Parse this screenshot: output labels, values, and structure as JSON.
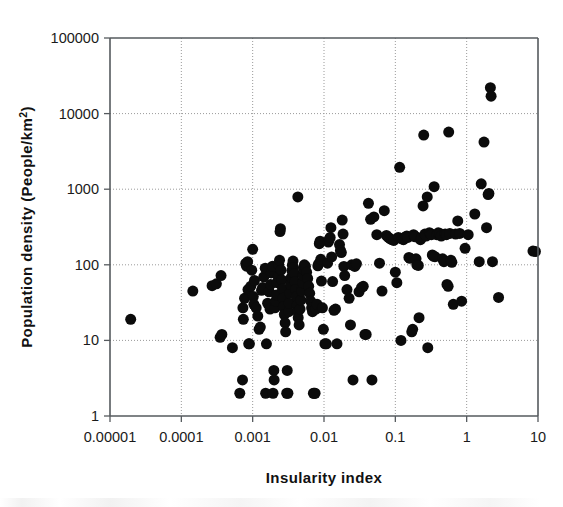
{
  "figure": {
    "background_color": "#ffffff",
    "marker_color": "#0b0b0b",
    "frame_color": "#555a5e",
    "grid_color": "#9a9a9a"
  },
  "chart_data": {
    "type": "scatter",
    "title": "",
    "xlabel": "Insularity index",
    "ylabel": "Population density (People/km2)",
    "ylabel_display": "Population density (People/km",
    "ylabel_superscript": "2",
    "ylabel_tail": ")",
    "xscale": "log",
    "yscale": "log",
    "xlim": [
      1e-05,
      10
    ],
    "ylim": [
      1,
      100000
    ],
    "grid": true,
    "legend": null,
    "xticks": [
      1e-05,
      0.0001,
      0.001,
      0.01,
      0.1,
      1,
      10
    ],
    "xtick_labels": [
      "0.00001",
      "0.0001",
      "0.001",
      "0.01",
      "0.1",
      "1",
      "10"
    ],
    "yticks": [
      1,
      10,
      100,
      1000,
      10000,
      100000
    ],
    "ytick_labels": [
      "1",
      "10",
      "100",
      "1000",
      "10000",
      "100000"
    ],
    "marker": "circle",
    "marker_size_px": 11,
    "n_points": 218,
    "points": [
      [
        1.95e-05,
        19
      ],
      [
        0.000145,
        45
      ],
      [
        0.00027,
        53
      ],
      [
        0.00031,
        56
      ],
      [
        0.00036,
        72
      ],
      [
        0.00035,
        11
      ],
      [
        0.00037,
        12
      ],
      [
        0.00052,
        8
      ],
      [
        0.00066,
        2
      ],
      [
        0.00072,
        3
      ],
      [
        0.00073,
        27
      ],
      [
        0.00074,
        19
      ],
      [
        0.00077,
        36
      ],
      [
        0.0008,
        104
      ],
      [
        0.00082,
        96
      ],
      [
        0.00085,
        110
      ],
      [
        0.00086,
        47
      ],
      [
        0.00088,
        9
      ],
      [
        0.0009,
        9
      ],
      [
        0.00094,
        52
      ],
      [
        0.00097,
        85
      ],
      [
        0.001,
        160
      ],
      [
        0.00102,
        38
      ],
      [
        0.00104,
        30
      ],
      [
        0.00106,
        62
      ],
      [
        0.00112,
        27
      ],
      [
        0.00118,
        21
      ],
      [
        0.00123,
        14
      ],
      [
        0.00128,
        15
      ],
      [
        0.00133,
        46
      ],
      [
        0.00138,
        50
      ],
      [
        0.00143,
        69
      ],
      [
        0.0015,
        90
      ],
      [
        0.00152,
        2
      ],
      [
        0.00156,
        9
      ],
      [
        0.00162,
        31
      ],
      [
        0.0017,
        44
      ],
      [
        0.00175,
        26
      ],
      [
        0.00178,
        55
      ],
      [
        0.00182,
        78
      ],
      [
        0.0019,
        96
      ],
      [
        0.00193,
        2
      ],
      [
        0.00198,
        4
      ],
      [
        0.002,
        3
      ],
      [
        0.00205,
        27
      ],
      [
        0.0021,
        33
      ],
      [
        0.00215,
        40
      ],
      [
        0.0022,
        58
      ],
      [
        0.00228,
        70
      ],
      [
        0.00233,
        100
      ],
      [
        0.00238,
        115
      ],
      [
        0.00242,
        275
      ],
      [
        0.00245,
        300
      ],
      [
        0.0025,
        85
      ],
      [
        0.00256,
        63
      ],
      [
        0.00262,
        48
      ],
      [
        0.00266,
        36
      ],
      [
        0.0027,
        28
      ],
      [
        0.00278,
        22
      ],
      [
        0.00285,
        17
      ],
      [
        0.0029,
        13
      ],
      [
        0.003,
        2
      ],
      [
        0.00305,
        4
      ],
      [
        0.00312,
        2
      ],
      [
        0.0032,
        24
      ],
      [
        0.00325,
        31
      ],
      [
        0.00332,
        42
      ],
      [
        0.0034,
        55
      ],
      [
        0.00348,
        68
      ],
      [
        0.00355,
        84
      ],
      [
        0.0036,
        99
      ],
      [
        0.00368,
        112
      ],
      [
        0.00375,
        92
      ],
      [
        0.00385,
        77
      ],
      [
        0.00392,
        60
      ],
      [
        0.004,
        47
      ],
      [
        0.0041,
        38
      ],
      [
        0.0042,
        29
      ],
      [
        0.00428,
        24
      ],
      [
        0.00435,
        20
      ],
      [
        0.0043,
        790
      ],
      [
        0.00448,
        16
      ],
      [
        0.00462,
        26
      ],
      [
        0.00475,
        34
      ],
      [
        0.00488,
        45
      ],
      [
        0.005,
        58
      ],
      [
        0.0051,
        72
      ],
      [
        0.0052,
        88
      ],
      [
        0.0053,
        100
      ],
      [
        0.0055,
        95
      ],
      [
        0.0057,
        80
      ],
      [
        0.0059,
        66
      ],
      [
        0.0061,
        52
      ],
      [
        0.0063,
        42
      ],
      [
        0.0065,
        33
      ],
      [
        0.0067,
        27
      ],
      [
        0.0069,
        24
      ],
      [
        0.0071,
        2
      ],
      [
        0.0073,
        2
      ],
      [
        0.0075,
        2
      ],
      [
        0.0077,
        26
      ],
      [
        0.008,
        30
      ],
      [
        0.0082,
        97
      ],
      [
        0.0084,
        103
      ],
      [
        0.0086,
        190
      ],
      [
        0.0088,
        205
      ],
      [
        0.009,
        118
      ],
      [
        0.0092,
        61
      ],
      [
        0.0095,
        27
      ],
      [
        0.0098,
        14
      ],
      [
        0.0103,
        9
      ],
      [
        0.0108,
        9
      ],
      [
        0.0112,
        105
      ],
      [
        0.0115,
        200
      ],
      [
        0.0118,
        215
      ],
      [
        0.0122,
        230
      ],
      [
        0.0125,
        310
      ],
      [
        0.0128,
        127
      ],
      [
        0.0132,
        60
      ],
      [
        0.0138,
        25
      ],
      [
        0.0145,
        26
      ],
      [
        0.0152,
        9
      ],
      [
        0.0165,
        185
      ],
      [
        0.017,
        155
      ],
      [
        0.0175,
        145
      ],
      [
        0.018,
        390
      ],
      [
        0.0185,
        255
      ],
      [
        0.019,
        95
      ],
      [
        0.0195,
        72
      ],
      [
        0.021,
        47
      ],
      [
        0.0225,
        36
      ],
      [
        0.0235,
        16
      ],
      [
        0.0245,
        100
      ],
      [
        0.0255,
        3
      ],
      [
        0.027,
        95
      ],
      [
        0.0285,
        103
      ],
      [
        0.031,
        44
      ],
      [
        0.0335,
        50
      ],
      [
        0.0355,
        52
      ],
      [
        0.0375,
        12
      ],
      [
        0.039,
        12
      ],
      [
        0.042,
        650
      ],
      [
        0.045,
        400
      ],
      [
        0.047,
        3
      ],
      [
        0.05,
        430
      ],
      [
        0.055,
        250
      ],
      [
        0.06,
        105
      ],
      [
        0.065,
        45
      ],
      [
        0.07,
        520
      ],
      [
        0.075,
        245
      ],
      [
        0.08,
        230
      ],
      [
        0.085,
        220
      ],
      [
        0.09,
        215
      ],
      [
        0.095,
        210
      ],
      [
        0.1,
        80
      ],
      [
        0.105,
        58
      ],
      [
        0.11,
        230
      ],
      [
        0.115,
        1950
      ],
      [
        0.118,
        225
      ],
      [
        0.12,
        10
      ],
      [
        0.125,
        220
      ],
      [
        0.13,
        215
      ],
      [
        0.135,
        225
      ],
      [
        0.14,
        235
      ],
      [
        0.145,
        240
      ],
      [
        0.15,
        230
      ],
      [
        0.155,
        125
      ],
      [
        0.16,
        122
      ],
      [
        0.17,
        13
      ],
      [
        0.175,
        14
      ],
      [
        0.18,
        250
      ],
      [
        0.185,
        240
      ],
      [
        0.19,
        235
      ],
      [
        0.195,
        120
      ],
      [
        0.2,
        100
      ],
      [
        0.21,
        98
      ],
      [
        0.215,
        20
      ],
      [
        0.225,
        215
      ],
      [
        0.235,
        230
      ],
      [
        0.245,
        600
      ],
      [
        0.25,
        5200
      ],
      [
        0.26,
        255
      ],
      [
        0.27,
        240
      ],
      [
        0.28,
        790
      ],
      [
        0.285,
        8
      ],
      [
        0.3,
        265
      ],
      [
        0.31,
        260
      ],
      [
        0.32,
        250
      ],
      [
        0.33,
        135
      ],
      [
        0.34,
        130
      ],
      [
        0.35,
        1080
      ],
      [
        0.36,
        128
      ],
      [
        0.38,
        250
      ],
      [
        0.4,
        265
      ],
      [
        0.42,
        260
      ],
      [
        0.44,
        240
      ],
      [
        0.46,
        120
      ],
      [
        0.48,
        110
      ],
      [
        0.5,
        255
      ],
      [
        0.52,
        250
      ],
      [
        0.53,
        55
      ],
      [
        0.55,
        52
      ],
      [
        0.56,
        5700
      ],
      [
        0.58,
        260
      ],
      [
        0.6,
        115
      ],
      [
        0.62,
        108
      ],
      [
        0.65,
        30
      ],
      [
        0.7,
        255
      ],
      [
        0.75,
        380
      ],
      [
        0.8,
        260
      ],
      [
        0.85,
        33
      ],
      [
        0.95,
        165
      ],
      [
        1.05,
        250
      ],
      [
        1.3,
        470
      ],
      [
        1.5,
        110
      ],
      [
        1.6,
        1180
      ],
      [
        1.75,
        4200
      ],
      [
        1.9,
        310
      ],
      [
        2.0,
        850
      ],
      [
        2.05,
        880
      ],
      [
        2.15,
        22000
      ],
      [
        2.2,
        17000
      ],
      [
        2.3,
        110
      ],
      [
        2.8,
        37
      ],
      [
        8.5,
        152
      ],
      [
        9.2,
        150
      ]
    ]
  }
}
